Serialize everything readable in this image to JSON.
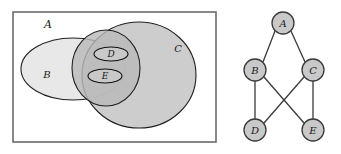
{
  "figure": {
    "type": "set-diagram-and-graph",
    "panels": [
      "venn-diagram",
      "containment-graph"
    ]
  },
  "venn": {
    "universe": {
      "name": "A",
      "label": "A",
      "label_x": 44,
      "label_y": 28,
      "shape": "rectangle",
      "x": 13,
      "y": 12,
      "width": 203,
      "height": 130,
      "fill": "#ffffff",
      "stroke": "#6b6b6b"
    },
    "sets": [
      {
        "name": "B",
        "label": "B",
        "shape": "ellipse",
        "cx": 73,
        "cy": 69,
        "rx": 52,
        "ry": 31,
        "fill": "#e8e8e8",
        "stroke": "#1f1f1f",
        "label_x": 47,
        "label_y": 74
      },
      {
        "name": "C",
        "label": "C",
        "shape": "ellipse",
        "cx": 139,
        "cy": 75,
        "rx": 57,
        "ry": 53,
        "fill": "#c6c6c6",
        "stroke": "#1f1f1f",
        "label_x": 178,
        "label_y": 48
      },
      {
        "name": "B-and-C-region",
        "label": "",
        "shape": "ellipse",
        "cx": 106,
        "cy": 68,
        "rx": 34,
        "ry": 38,
        "fill": "#b9b9b9",
        "stroke": "#1f1f1f",
        "label_x": 0,
        "label_y": 0
      },
      {
        "name": "D",
        "label": "D",
        "shape": "ellipse",
        "cx": 111,
        "cy": 54,
        "rx": 17,
        "ry": 7,
        "fill": "#c9c9c9",
        "stroke": "#111111",
        "label_x": 111,
        "label_y": 54
      },
      {
        "name": "E",
        "label": "E",
        "shape": "ellipse",
        "cx": 105,
        "cy": 76,
        "rx": 17,
        "ry": 7,
        "fill": "#c9c9c9",
        "stroke": "#111111",
        "label_x": 105,
        "label_y": 76
      }
    ]
  },
  "graph": {
    "node_radius": 11,
    "node_fill": "#c9c9c9",
    "node_stroke": "#3a3a3a",
    "edge_stroke": "#3a3a3a",
    "nodes": [
      {
        "id": "A",
        "label": "A",
        "cx": 58,
        "cy": 23
      },
      {
        "id": "B",
        "label": "B",
        "cx": 30,
        "cy": 70
      },
      {
        "id": "C",
        "label": "C",
        "cx": 88,
        "cy": 70
      },
      {
        "id": "D",
        "label": "D",
        "cx": 30,
        "cy": 130
      },
      {
        "id": "E",
        "label": "E",
        "cx": 88,
        "cy": 130
      }
    ],
    "edges": [
      {
        "from": "A",
        "to": "B",
        "x1": 50,
        "y1": 31,
        "x2": 38,
        "y2": 62
      },
      {
        "from": "A",
        "to": "C",
        "x1": 66,
        "y1": 31,
        "x2": 80,
        "y2": 62
      },
      {
        "from": "B",
        "to": "D",
        "x1": 30,
        "y1": 81,
        "x2": 30,
        "y2": 119
      },
      {
        "from": "B",
        "to": "E",
        "x1": 39,
        "y1": 77,
        "x2": 79,
        "y2": 123
      },
      {
        "from": "C",
        "to": "D",
        "x1": 79,
        "y1": 77,
        "x2": 39,
        "y2": 123
      },
      {
        "from": "C",
        "to": "E",
        "x1": 88,
        "y1": 81,
        "x2": 88,
        "y2": 119
      }
    ]
  }
}
